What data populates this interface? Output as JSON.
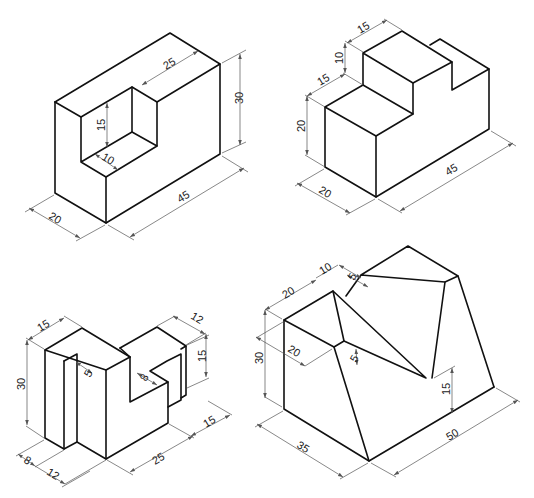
{
  "figures": [
    {
      "name": "block-with-slot",
      "dims": {
        "d25": "25",
        "d30": "30",
        "d15": "15",
        "d10": "10",
        "d20": "20",
        "d45": "45"
      }
    },
    {
      "name": "stepped-block-with-notch",
      "dims": {
        "d15a": "15",
        "d10": "10",
        "d15b": "15",
        "d20a": "20",
        "d20b": "20",
        "d45": "45"
      }
    },
    {
      "name": "l-bracket-block",
      "dims": {
        "d15a": "15",
        "d12a": "12",
        "d30": "30",
        "d5": "5",
        "d8a": "8",
        "d15b": "15",
        "d15c": "15",
        "d25": "25",
        "d8b": "8",
        "d12b": "12"
      }
    },
    {
      "name": "chamfered-block",
      "dims": {
        "d10": "10",
        "d20a": "20",
        "d5a": "5",
        "d30": "30",
        "d20b": "20",
        "d5b": "5",
        "d15": "15",
        "d35": "35",
        "d50": "50"
      }
    }
  ]
}
